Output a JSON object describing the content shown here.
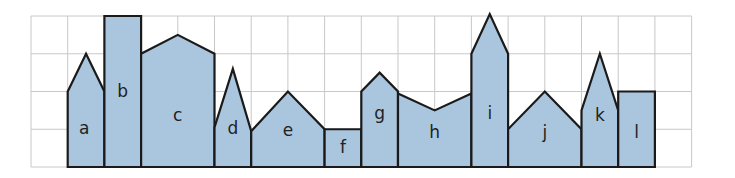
{
  "grid": {
    "columns": 18,
    "rows": 4,
    "origin_x": 31,
    "origin_y": 16,
    "cell_width": 36.7,
    "cell_height": 37.75,
    "line_color": "#c8c8c8"
  },
  "colors": {
    "building_fill": "#a9c6de",
    "building_stroke": "#1a1a1a"
  },
  "buildings": [
    {
      "label": "a",
      "points": [
        [
          1,
          0
        ],
        [
          1,
          2
        ],
        [
          1.5,
          3
        ],
        [
          2,
          2
        ],
        [
          2,
          0
        ]
      ],
      "label_pos": [
        1.45,
        1.0
      ]
    },
    {
      "label": "b",
      "points": [
        [
          2,
          0
        ],
        [
          2,
          4
        ],
        [
          3,
          4
        ],
        [
          3,
          0
        ]
      ],
      "label_pos": [
        2.5,
        2.0
      ]
    },
    {
      "label": "c",
      "points": [
        [
          3,
          0
        ],
        [
          3,
          3
        ],
        [
          4,
          3.5
        ],
        [
          5,
          3
        ],
        [
          5,
          0
        ]
      ],
      "label_pos": [
        4.0,
        1.35
      ]
    },
    {
      "label": "d",
      "points": [
        [
          5,
          0
        ],
        [
          5,
          1.05
        ],
        [
          5.5,
          2.6
        ],
        [
          6,
          0.95
        ],
        [
          6,
          0
        ]
      ],
      "label_pos": [
        5.5,
        1.0
      ]
    },
    {
      "label": "e",
      "points": [
        [
          6,
          0
        ],
        [
          6,
          0.95
        ],
        [
          7,
          2
        ],
        [
          8,
          1
        ],
        [
          8,
          0
        ]
      ],
      "label_pos": [
        7.0,
        0.95
      ]
    },
    {
      "label": "f",
      "points": [
        [
          8,
          0
        ],
        [
          8,
          1
        ],
        [
          9,
          1
        ],
        [
          9,
          0
        ]
      ],
      "label_pos": [
        8.5,
        0.5
      ]
    },
    {
      "label": "g",
      "points": [
        [
          9,
          0
        ],
        [
          9,
          2
        ],
        [
          9.5,
          2.5
        ],
        [
          10,
          2
        ],
        [
          10,
          0
        ]
      ],
      "label_pos": [
        9.5,
        1.4
      ]
    },
    {
      "label": "h",
      "points": [
        [
          10,
          0
        ],
        [
          10,
          1.95
        ],
        [
          11,
          1.5
        ],
        [
          12,
          1.95
        ],
        [
          12,
          0
        ]
      ],
      "label_pos": [
        11.0,
        0.9
      ]
    },
    {
      "label": "i",
      "points": [
        [
          12,
          0
        ],
        [
          12,
          3
        ],
        [
          12.5,
          4.05
        ],
        [
          13,
          3
        ],
        [
          13,
          0
        ]
      ],
      "label_pos": [
        12.5,
        1.4
      ]
    },
    {
      "label": "j",
      "points": [
        [
          13,
          0
        ],
        [
          13,
          1
        ],
        [
          14,
          2
        ],
        [
          15,
          1
        ],
        [
          15,
          0
        ]
      ],
      "label_pos": [
        14.0,
        0.9
      ]
    },
    {
      "label": "k",
      "points": [
        [
          15,
          0
        ],
        [
          15,
          1.5
        ],
        [
          15.5,
          3
        ],
        [
          16,
          1.5
        ],
        [
          16,
          0
        ]
      ],
      "label_pos": [
        15.5,
        1.35
      ]
    },
    {
      "label": "l",
      "points": [
        [
          16,
          0
        ],
        [
          16,
          2
        ],
        [
          17,
          2
        ],
        [
          17,
          0
        ]
      ],
      "label_pos": [
        16.5,
        0.9
      ]
    }
  ]
}
